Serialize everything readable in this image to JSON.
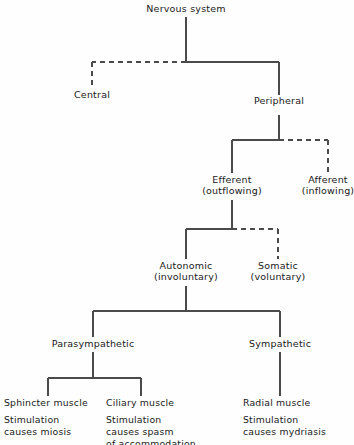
{
  "diagram": {
    "title_node": "Nervous system",
    "root": {
      "label": "Nervous system"
    },
    "level_2": {
      "central": {
        "label": "Central",
        "line_style": "dashed"
      },
      "peripheral": {
        "label": "Peripheral",
        "line_style": "solid"
      }
    },
    "level_3": {
      "efferent": {
        "label": "Efferent",
        "sublabel": "(outflowing)",
        "line_style": "solid"
      },
      "afferent": {
        "label": "Afferent",
        "sublabel": "(inflowing)",
        "line_style": "dashed"
      }
    },
    "level_4": {
      "autonomic": {
        "label": "Autonomic",
        "sublabel": "(involuntary)",
        "line_style": "solid"
      },
      "somatic": {
        "label": "Somatic",
        "sublabel": "(voluntary)",
        "line_style": "dashed"
      }
    },
    "level_5": {
      "parasympathetic": {
        "label": "Parasympathetic",
        "line_style": "solid"
      },
      "sympathetic": {
        "label": "Sympathetic",
        "line_style": "solid"
      }
    },
    "level_6": {
      "sphincter": {
        "title": "Sphincter muscle",
        "desc_line_1": "Stimulation",
        "desc_line_2": "causes miosis",
        "desc_line_3": ""
      },
      "ciliary": {
        "title": "Ciliary muscle",
        "desc_line_1": "Stimulation",
        "desc_line_2": "causes spasm",
        "desc_line_3": "of accommodation"
      },
      "radial": {
        "title": "Radial muscle",
        "desc_line_1": "Stimulation",
        "desc_line_2": "causes mydriasis",
        "desc_line_3": ""
      }
    },
    "colors": {
      "background": "#fefefe",
      "line": "#4a4a4a",
      "text": "#1a1a1a"
    }
  }
}
